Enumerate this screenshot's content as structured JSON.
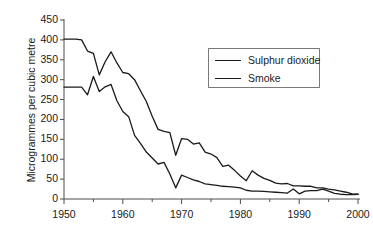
{
  "chart_data": {
    "type": "line",
    "title": "",
    "xlabel": "",
    "ylabel": "Microgrammes per cubic metre",
    "xlim": [
      1950,
      2000
    ],
    "ylim": [
      0,
      450
    ],
    "yticks": [
      0,
      50,
      100,
      150,
      200,
      250,
      300,
      350,
      400,
      450
    ],
    "xticks": [
      1950,
      1960,
      1970,
      1980,
      1990,
      2000
    ],
    "xminor_step": 5,
    "grid": false,
    "legend_position": "top-right",
    "x": [
      1950,
      1951,
      1952,
      1953,
      1954,
      1955,
      1956,
      1957,
      1958,
      1959,
      1960,
      1961,
      1962,
      1963,
      1964,
      1965,
      1966,
      1967,
      1968,
      1969,
      1970,
      1971,
      1972,
      1973,
      1974,
      1975,
      1976,
      1977,
      1978,
      1979,
      1980,
      1981,
      1982,
      1983,
      1984,
      1985,
      1986,
      1987,
      1988,
      1989,
      1990,
      1991,
      1992,
      1993,
      1994,
      1995,
      1996,
      1997,
      1998,
      1999,
      2000
    ],
    "series": [
      {
        "name": "Sulphur dioxide",
        "color": "#1a1a1a",
        "values": [
          402,
          402,
          402,
          400,
          372,
          366,
          312,
          345,
          370,
          342,
          318,
          315,
          300,
          272,
          245,
          208,
          175,
          170,
          167,
          110,
          152,
          150,
          138,
          141,
          118,
          113,
          104,
          82,
          85,
          72,
          58,
          46,
          71,
          60,
          52,
          47,
          40,
          38,
          39,
          33,
          33,
          32,
          32,
          28,
          28,
          25,
          23,
          20,
          17,
          13,
          12
        ]
      },
      {
        "name": "Smoke",
        "color": "#1a1a1a",
        "values": [
          281,
          281,
          281,
          281,
          262,
          308,
          270,
          282,
          288,
          247,
          220,
          207,
          160,
          140,
          118,
          103,
          88,
          92,
          63,
          28,
          60,
          54,
          48,
          44,
          38,
          36,
          34,
          32,
          31,
          30,
          28,
          22,
          20,
          20,
          19,
          18,
          17,
          16,
          15,
          25,
          13,
          20,
          21,
          21,
          25,
          20,
          14,
          12,
          11,
          11,
          12
        ]
      }
    ],
    "legend": [
      {
        "label": "Sulphur dioxide"
      },
      {
        "label": "Smoke"
      }
    ]
  },
  "layout": {
    "plot_left": 64,
    "plot_right": 358,
    "plot_top": 20,
    "plot_bottom": 199,
    "legend": {
      "left": 208,
      "top": 48,
      "width": 112,
      "height": 40
    }
  }
}
